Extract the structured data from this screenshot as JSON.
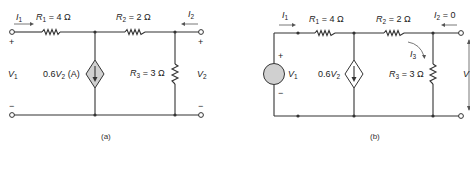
{
  "figure_a": {
    "caption": "(a)",
    "i1": "I",
    "i1_sub": "1",
    "i2": "I",
    "i2_sub": "2",
    "r1": "R",
    "r1_sub": "1",
    "r1_val": " = 4 Ω",
    "r2": "R",
    "r2_sub": "2",
    "r2_val": " = 2 Ω",
    "r3": "R",
    "r3_sub": "3",
    "r3_val": " = 3 Ω",
    "src_pre": "0.6",
    "src_v": "V",
    "src_sub": "2",
    "src_post": " (A)",
    "v1": "V",
    "v1_sub": "1",
    "v2": "V",
    "v2_sub": "2",
    "plus": "+",
    "minus": "−"
  },
  "figure_b": {
    "caption": "(b)",
    "i1": "I",
    "i1_sub": "1",
    "i2": "I",
    "i2_sub": "2",
    "i2_val": " = 0",
    "i3": "I",
    "i3_sub": "3",
    "r1": "R",
    "r1_sub": "1",
    "r1_val": " = 4 Ω",
    "r2": "R",
    "r2_sub": "2",
    "r2_val": " = 2 Ω",
    "r3": "R",
    "r3_sub": "3",
    "r3_val": " = 3 Ω",
    "src_pre": "0.6",
    "src_v": "V",
    "src_sub": "2",
    "v1": "V",
    "v1_sub": "1",
    "v2": "V",
    "plus": "+",
    "minus": "−"
  },
  "colors": {
    "wire": "#333333",
    "source_fill": "#d0d0d0"
  }
}
